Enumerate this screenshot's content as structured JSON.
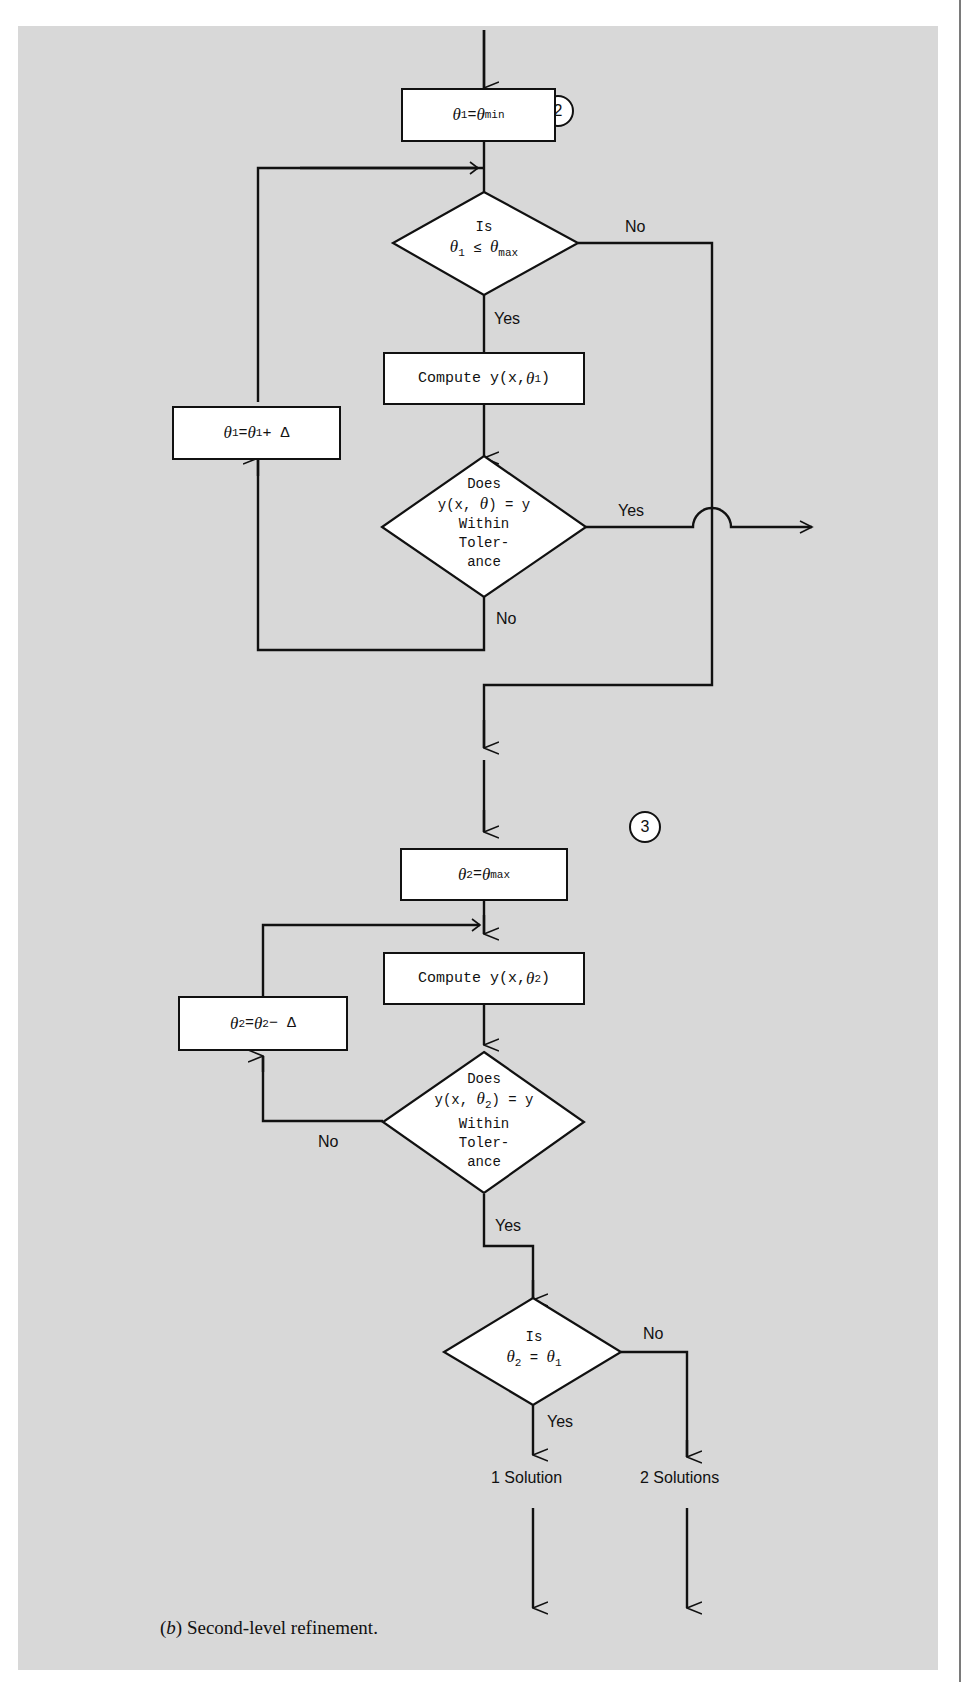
{
  "figure": {
    "caption_label": "b",
    "caption_text": "Second-level refinement.",
    "background_color": "#d8d8d8"
  },
  "connectors": [
    {
      "id": "2",
      "label": "2"
    },
    {
      "id": "3",
      "label": "3"
    }
  ],
  "section2": {
    "init_box": {
      "var": "θ",
      "sub": "1",
      "eq": " = ",
      "rhs": "θ",
      "rhs_sub": "min"
    },
    "decision1": {
      "line1": "Is",
      "lhs": "θ",
      "lhs_sub": "1",
      "op": " ≤ ",
      "rhs": "θ",
      "rhs_sub": "max"
    },
    "decision1_yes": "Yes",
    "decision1_no": "No",
    "compute_box": {
      "text": "Compute y(x, ",
      "var": "θ",
      "sub": "1",
      "close": ")"
    },
    "increment_box": {
      "var": "θ",
      "sub": "1",
      "eq": " = ",
      "rhs": "θ",
      "rhs_sub": "1",
      "tail": " + Δ"
    },
    "decision2": {
      "line1": "Does",
      "line2_pre": "y(x, ",
      "line2_var": "θ",
      "line2_post": ") = y",
      "line3": "Within",
      "line4": "Toler-",
      "line5": "ance"
    },
    "decision2_yes": "Yes",
    "decision2_no": "No"
  },
  "section3": {
    "init_box": {
      "var": "θ",
      "sub": "2",
      "eq": " = ",
      "rhs": "θ",
      "rhs_sub": "max"
    },
    "compute_box": {
      "text": "Compute y(x, ",
      "var": "θ",
      "sub": "2",
      "close": ")"
    },
    "decrement_box": {
      "var": "θ",
      "sub": "2",
      "eq": " = ",
      "rhs": "θ",
      "rhs_sub": "2",
      "tail": " − Δ"
    },
    "decision1": {
      "line1": "Does",
      "line2_pre": "y(x, ",
      "line2_var": "θ",
      "line2_sub": "2",
      "line2_post": ") = y",
      "line3": "Within",
      "line4": "Toler-",
      "line5": "ance"
    },
    "decision1_yes": "Yes",
    "decision1_no": "No",
    "decision2": {
      "line1": "Is",
      "lhs": "θ",
      "lhs_sub": "2",
      "op": " = ",
      "rhs": "θ",
      "rhs_sub": "1"
    },
    "decision2_yes": "Yes",
    "decision2_no": "No",
    "outcome_one": "1 Solution",
    "outcome_two": "2 Solutions"
  }
}
